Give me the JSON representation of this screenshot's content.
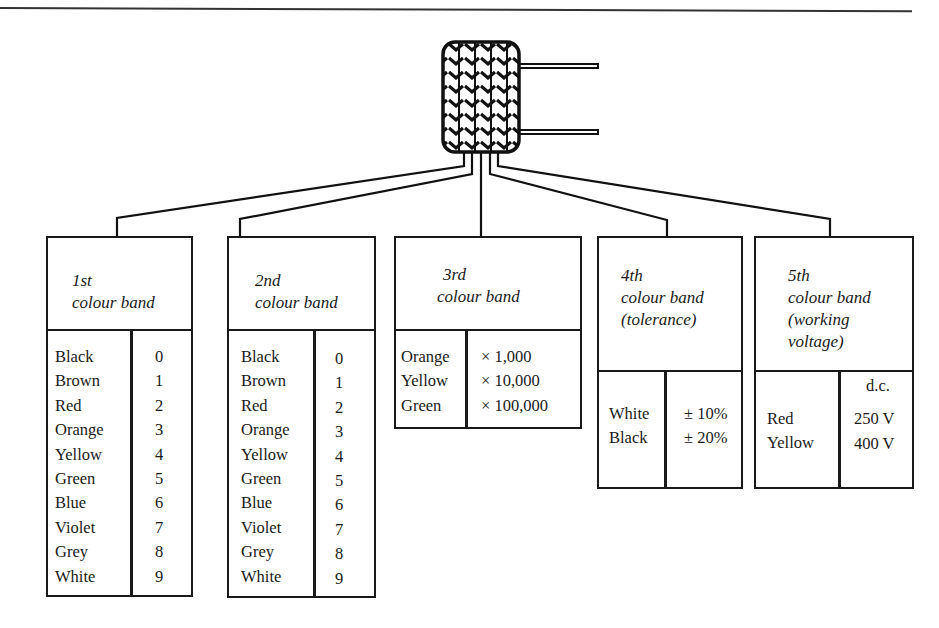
{
  "diagram": {
    "component_icon": "capacitor-icon",
    "bands": [
      {
        "label_lines": [
          "1st",
          "colour band"
        ],
        "colours": [
          "Black",
          "Brown",
          "Red",
          "Orange",
          "Yellow",
          "Green",
          "Blue",
          "Violet",
          "Grey",
          "White"
        ],
        "values": [
          "0",
          "1",
          "2",
          "3",
          "4",
          "5",
          "6",
          "7",
          "8",
          "9"
        ]
      },
      {
        "label_lines": [
          "2nd",
          "colour band"
        ],
        "colours": [
          "Black",
          "Brown",
          "Red",
          "Orange",
          "Yellow",
          "Green",
          "Blue",
          "Violet",
          "Grey",
          "White"
        ],
        "values": [
          "0",
          "1",
          "2",
          "3",
          "4",
          "5",
          "6",
          "7",
          "8",
          "9"
        ]
      },
      {
        "label_lines": [
          "3rd",
          "colour band"
        ],
        "colours": [
          "Orange",
          "Yellow",
          "Green"
        ],
        "values": [
          "× 1,000",
          "× 10,000",
          "× 100,000"
        ]
      },
      {
        "label_lines": [
          "4th",
          "colour band",
          "(tolerance)"
        ],
        "colours": [
          "White",
          "Black"
        ],
        "values": [
          "± 10%",
          "± 20%"
        ]
      },
      {
        "label_lines": [
          "5th",
          "colour band",
          "(working",
          "voltage)"
        ],
        "value_header": "d.c.",
        "colours": [
          "Red",
          "Yellow"
        ],
        "values": [
          "250 V",
          "400 V"
        ]
      }
    ]
  }
}
